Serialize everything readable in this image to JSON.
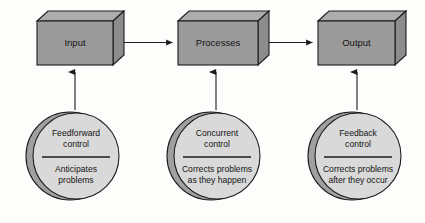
{
  "diagram": {
    "background_color": "#fdfdfc",
    "palette": {
      "box_front": "#9b9b9b",
      "box_top": "#adadad",
      "box_side": "#8c8c8c",
      "circle_fill": "#d9d9d9",
      "circle_shadow": "#a0a0a0",
      "outline": "#1c1c1c",
      "text": "#141414"
    },
    "stages": [
      {
        "id": "input",
        "box_label": "Input",
        "circle_title_line1": "Feedforward",
        "circle_title_line2": "control",
        "circle_desc_line1": "Anticipates",
        "circle_desc_line2": "problems"
      },
      {
        "id": "processes",
        "box_label": "Processes",
        "circle_title_line1": "Concurrent",
        "circle_title_line2": "control",
        "circle_desc_line1": "Corrects problems",
        "circle_desc_line2": "as they happen"
      },
      {
        "id": "output",
        "box_label": "Output",
        "circle_title_line1": "Feedback",
        "circle_title_line2": "control",
        "circle_desc_line1": "Corrects problems",
        "circle_desc_line2": "after they occur"
      }
    ],
    "connectors": [
      {
        "id": "input-to-processes",
        "from": "input",
        "to": "processes",
        "direction": "right"
      },
      {
        "id": "processes-to-output",
        "from": "processes",
        "to": "output",
        "direction": "right"
      },
      {
        "id": "feedforward-to-input",
        "from": "feedforward-control",
        "to": "input",
        "direction": "up"
      },
      {
        "id": "concurrent-to-processes",
        "from": "concurrent-control",
        "to": "processes",
        "direction": "up"
      },
      {
        "id": "feedback-to-output",
        "from": "feedback-control",
        "to": "output",
        "direction": "up"
      }
    ]
  }
}
